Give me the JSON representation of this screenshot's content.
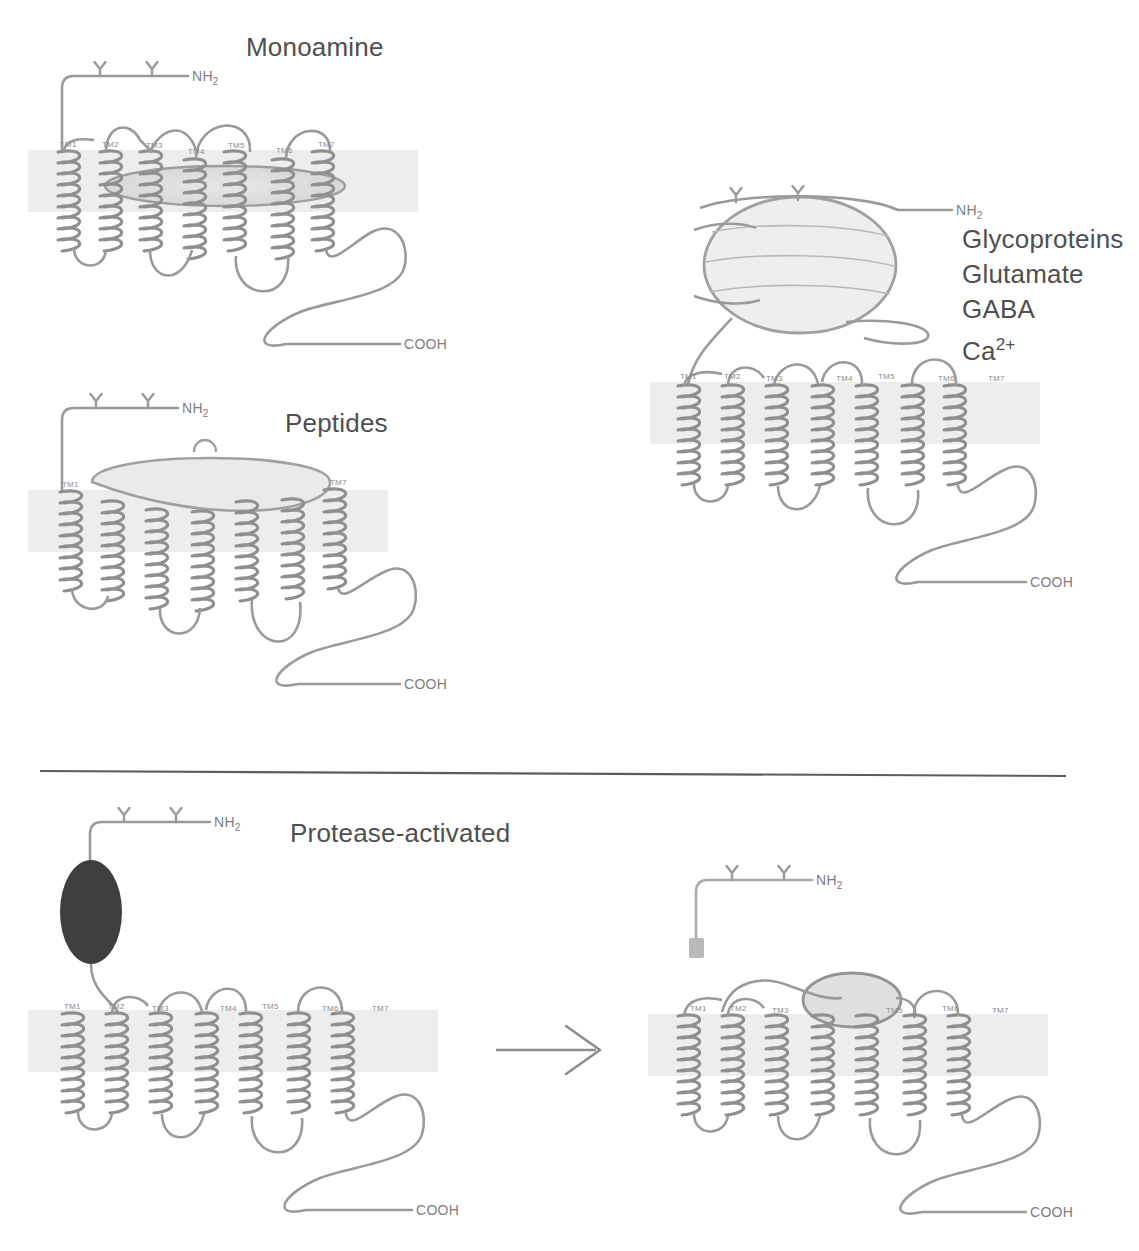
{
  "figure": {
    "type": "diagram",
    "background_color": "#ffffff",
    "ink_color": "#8a8a8a",
    "membrane_color": "#ececec",
    "pocket_fill": "#e2e2e2",
    "protease_blob_color": "#3a3a3a"
  },
  "panels": {
    "monoamine": {
      "title": "Monoamine",
      "n_terminus": "NH",
      "n_terminus_sub": "2",
      "c_terminus": "COOH",
      "tm_labels": [
        "TM1",
        "TM2",
        "TM3",
        "TM4",
        "TM5",
        "TM6",
        "TM7"
      ],
      "glycosylation_count": 2,
      "binding_site": "within-membrane lens pocket"
    },
    "peptides": {
      "title": "Peptides",
      "n_terminus": "NH",
      "n_terminus_sub": "2",
      "c_terminus": "COOH",
      "tm_labels": [
        "TM1",
        "TM7"
      ],
      "glycosylation_count": 2,
      "binding_site": "shallow extracellular dish"
    },
    "glycoproteins": {
      "ligands": [
        "Glycoproteins",
        "Glutamate",
        "GABA",
        "Ca"
      ],
      "ca_superscript": "2+",
      "n_terminus": "NH",
      "n_terminus_sub": "2",
      "c_terminus": "COOH",
      "tm_labels": [
        "TM1",
        "TM2",
        "TM3",
        "TM4",
        "TM5",
        "TM6",
        "TM7"
      ],
      "glycosylation_count": 2,
      "binding_site": "large extracellular globular domain"
    },
    "protease_activated": {
      "title": "Protease-activated",
      "left": {
        "n_terminus": "NH",
        "n_terminus_sub": "2",
        "c_terminus": "COOH",
        "tm_labels": [
          "TM1",
          "TM2",
          "TM3",
          "TM4",
          "TM5",
          "TM6",
          "TM7"
        ],
        "glycosylation_count": 2,
        "tethered_ligand": "uncleaved dark pro-domain"
      },
      "arrow": "→",
      "right": {
        "n_terminus": "NH",
        "n_terminus_sub": "2",
        "c_terminus": "COOH",
        "tm_labels": [
          "TM1",
          "TM2",
          "TM3",
          "TM4",
          "TM5",
          "TM6",
          "TM7"
        ],
        "glycosylation_count": 2,
        "tethered_ligand": "cleaved fragment released; tethered ligand docked"
      }
    }
  },
  "divider": {
    "present": true
  }
}
